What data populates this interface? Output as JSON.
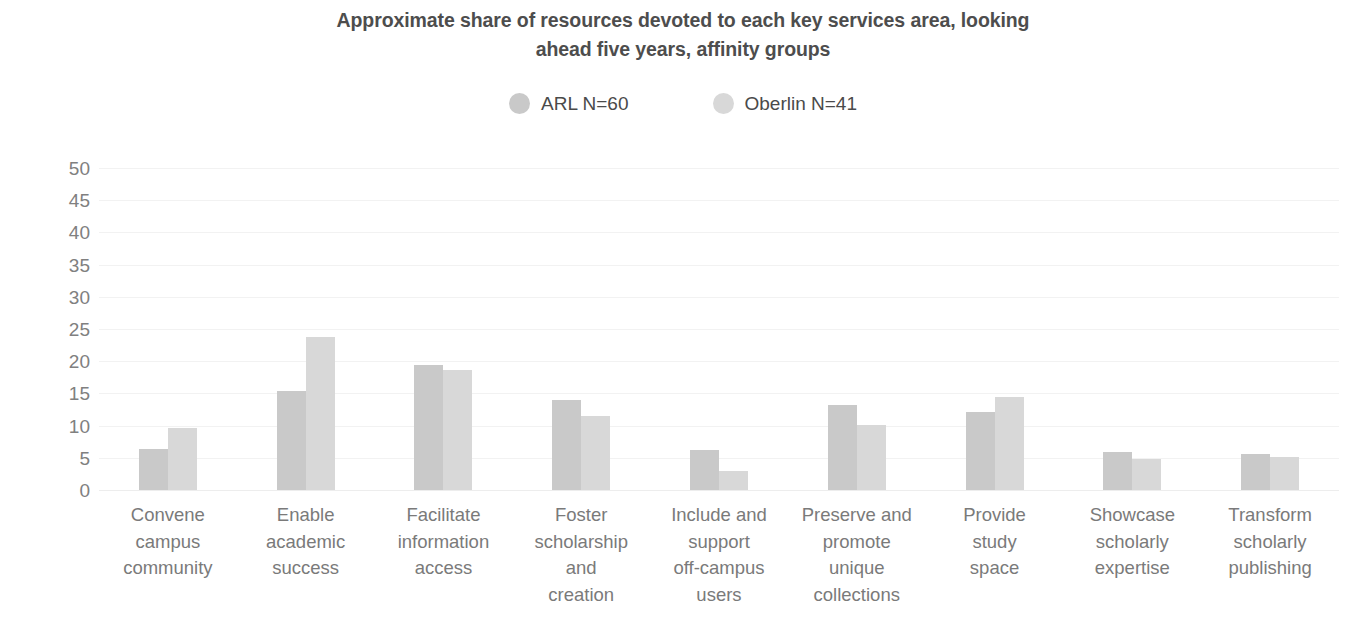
{
  "chart_data": {
    "type": "bar",
    "title": "Approximate share of resources devoted to each key services area, looking ahead five years, affinity groups",
    "title_lines": [
      "Approximate share of resources devoted to each key services area, looking",
      "ahead five years, affinity groups"
    ],
    "xlabel": "",
    "ylabel": "",
    "ylim": [
      0,
      50
    ],
    "ytick_step": 5,
    "yticks": [
      "50",
      "45",
      "40",
      "35",
      "30",
      "25",
      "20",
      "15",
      "10",
      "5",
      "0"
    ],
    "grid": true,
    "legend_position": "top-center",
    "categories": [
      "Convene campus community",
      "Enable academic success",
      "Facilitate information access",
      "Foster scholarship and creation",
      "Include and support off-campus users",
      "Preserve and promote unique collections",
      "Provide study space",
      "Showcase scholarly expertise",
      "Transform scholarly publishing"
    ],
    "category_lines": [
      [
        "Convene",
        "campus",
        "community"
      ],
      [
        "Enable",
        "academic",
        "success"
      ],
      [
        "Facilitate",
        "information",
        "access"
      ],
      [
        "Foster",
        "scholarship",
        "and",
        "creation"
      ],
      [
        "Include and",
        "support",
        "off-campus",
        "users"
      ],
      [
        "Preserve and",
        "promote",
        "unique",
        "collections"
      ],
      [
        "Provide",
        "study",
        "space"
      ],
      [
        "Showcase",
        "scholarly",
        "expertise"
      ],
      [
        "Transform",
        "scholarly",
        "publishing"
      ]
    ],
    "series": [
      {
        "name": "ARL N=60",
        "color": "#c9c9c9",
        "values": [
          6.4,
          15.4,
          19.4,
          14.0,
          6.2,
          13.2,
          12.1,
          5.9,
          5.6
        ]
      },
      {
        "name": "Oberlin N=41",
        "color": "#d8d8d8",
        "values": [
          9.6,
          23.7,
          18.6,
          11.5,
          2.9,
          10.1,
          14.4,
          4.8,
          5.2
        ]
      }
    ]
  },
  "legend": {
    "items": [
      {
        "label": "ARL N=60",
        "color": "#c9c9c9"
      },
      {
        "label": "Oberlin N=41",
        "color": "#d8d8d8"
      }
    ]
  },
  "colors": {
    "arl": "#c9c9c9",
    "oberlin": "#d8d8d8",
    "title": "#4d4d4d",
    "axis_text": "#808080",
    "label_text": "#7a7a7a",
    "gridline": "#f2f2f2"
  }
}
